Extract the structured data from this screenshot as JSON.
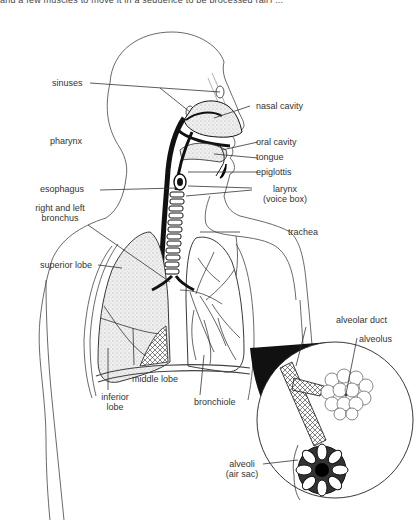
{
  "figure": {
    "cropped_header_text": "and a few muscles to move it in a sequence to be processed (air) ..."
  },
  "labels": {
    "sinuses": "sinuses",
    "nasal_cavity": "nasal cavity",
    "pharynx": "pharynx",
    "oral_cavity": "oral cavity",
    "tongue": "tongue",
    "epiglottis": "epiglottis",
    "esophagus": "esophagus",
    "larynx_line1": "larynx",
    "larynx_line2": "(voice box)",
    "bronchus_line1": "right and left",
    "bronchus_line2": "bronchus",
    "trachea": "trachea",
    "superior_lobe": "superior lobe",
    "alveolar_duct": "alveolar duct",
    "alveolus": "alveolus",
    "middle_lobe": "middle lobe",
    "inferior_line1": "inferior",
    "inferior_line2": "lobe",
    "bronchiole": "bronchiole",
    "alveoli_line1": "alveoli",
    "alveoli_line2": "(air sac)"
  },
  "colors": {
    "ink": "#1a1a1a",
    "line": "#555555",
    "stipple": "#d8d8d8",
    "background": "#ffffff"
  }
}
